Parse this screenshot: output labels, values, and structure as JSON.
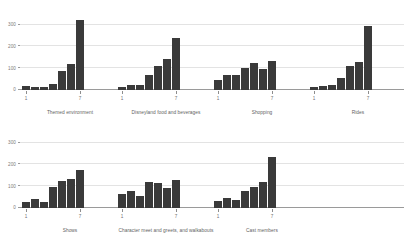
{
  "figure": {
    "background_color": "#ffffff",
    "bar_color": "#3a3a3a",
    "gridline_color": "#e3e3e3",
    "axis_color": "#9a9a9a",
    "text_color": "#6b6b6b"
  },
  "axis": {
    "y_ticks": [
      "0",
      "100",
      "200",
      "300"
    ],
    "y_tick_values": [
      0,
      100,
      200,
      300
    ],
    "x_ticks": [
      "1",
      "7"
    ],
    "x_tick_positions": [
      1,
      7
    ]
  },
  "chart_data": {
    "type": "bar",
    "title": "",
    "subtitle": "",
    "xlabel": "",
    "ylabel": "",
    "ylim": [
      0,
      330
    ],
    "xlim": [
      0.5,
      7.5
    ],
    "grid": true,
    "legend": "none",
    "layout": {
      "rows": 2,
      "cols_top": 4,
      "cols_bottom": 3,
      "shared_y_axis": true,
      "shared_x_axis": true
    },
    "categories": [
      "1",
      "2",
      "3",
      "4",
      "5",
      "6",
      "7"
    ],
    "panels": [
      {
        "row": 0,
        "col": 0,
        "title": "Themed environment",
        "values": [
          18,
          12,
          14,
          28,
          85,
          120,
          320
        ]
      },
      {
        "row": 0,
        "col": 1,
        "title": "Disneyland food and beverages",
        "values": [
          15,
          25,
          22,
          70,
          110,
          140,
          240
        ]
      },
      {
        "row": 0,
        "col": 2,
        "title": "Shopping",
        "values": [
          45,
          68,
          70,
          102,
          122,
          98,
          132
        ]
      },
      {
        "row": 0,
        "col": 3,
        "title": "Rides",
        "values": [
          12,
          18,
          25,
          55,
          110,
          128,
          295
        ]
      },
      {
        "row": 1,
        "col": 0,
        "title": "Shows",
        "values": [
          28,
          42,
          28,
          97,
          122,
          132,
          175
        ]
      },
      {
        "row": 1,
        "col": 1,
        "title": "Character meet and greets, and walkabouts",
        "values": [
          62,
          78,
          57,
          118,
          115,
          90,
          127
        ]
      },
      {
        "row": 1,
        "col": 2,
        "title": "Cast members",
        "values": [
          32,
          45,
          38,
          80,
          98,
          120,
          235
        ]
      }
    ]
  }
}
